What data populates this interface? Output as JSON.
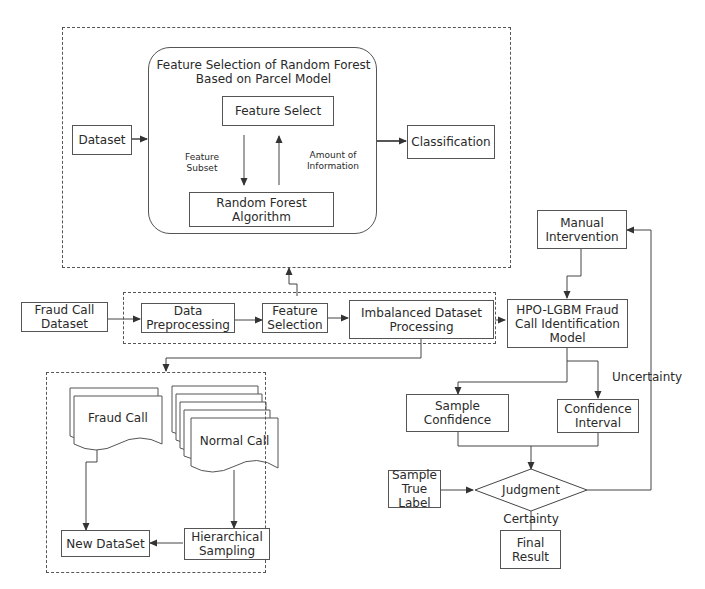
{
  "top_module": {
    "title": "Feature Selection of Random Forest Based on Parcel Model",
    "dataset": "Dataset",
    "feature_select": "Feature Select",
    "random_forest": "Random Forest Algorithm",
    "feature_subset": "Feature Subset",
    "amount_of_information": "Amount of Information",
    "classification": "Classification"
  },
  "pipeline": {
    "fraud_call_dataset": "Fraud Call Dataset",
    "data_preprocessing": "Data Preprocessing",
    "feature_selection": "Feature Selection",
    "imbalanced_processing": "Imbalanced Dataset Processing"
  },
  "sampling_module": {
    "fraud_call": "Fraud Call",
    "normal_call": "Normal Call",
    "new_dataset": "New DataSet",
    "hierarchical_sampling": "Hierarchical Sampling"
  },
  "model_module": {
    "manual_intervention": "Manual Intervention",
    "hpo_lgbm": "HPO-LGBM Fraud Call Identification Model",
    "uncertainty": "Uncertainty",
    "sample_confidence": "Sample Confidence",
    "confidence_interval": "Confidence Interval",
    "sample_true_label": "Sample True Label",
    "judgment": "Judgment",
    "certainty": "Certainty",
    "final_result": "Final Result"
  }
}
